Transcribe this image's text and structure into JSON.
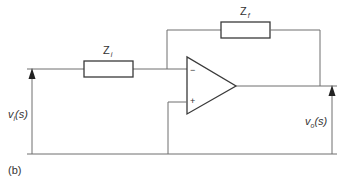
{
  "diagram": {
    "caption": "(b)",
    "components": {
      "input_impedance": {
        "symbol": "Z",
        "subscript": "i"
      },
      "feedback_impedance": {
        "symbol": "Z",
        "subscript": "f"
      },
      "opamp": {
        "inverting_sign": "−",
        "noninverting_sign": "+"
      }
    },
    "signals": {
      "input": {
        "symbol": "v",
        "subscript": "i",
        "argument": "(s)"
      },
      "output": {
        "symbol": "v",
        "subscript": "o",
        "argument": "(s)"
      }
    },
    "colors": {
      "wire": "#6e6e6e",
      "outline": "#3a3a3a",
      "text": "#333333"
    }
  }
}
